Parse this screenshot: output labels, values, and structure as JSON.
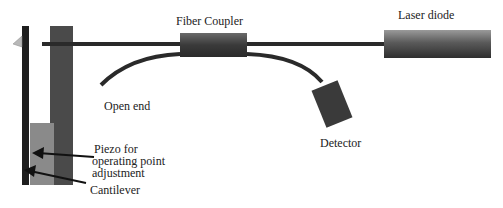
{
  "diagram": {
    "labels": {
      "fiber_coupler": "Fiber Coupler",
      "laser_diode": "Laser diode",
      "open_end": "Open end",
      "detector": "Detector",
      "piezo_line1": "Piezo for",
      "piezo_line2": "operating point",
      "piezo_line3": "adjustment",
      "cantilever": "Cantilever"
    },
    "colors": {
      "fiber": "#2a2a2a",
      "holder": "#4a4a4a",
      "piezo": "#8a8a8a",
      "cantilever": "#1e1e1e",
      "tip": "#b8b8b8"
    }
  }
}
